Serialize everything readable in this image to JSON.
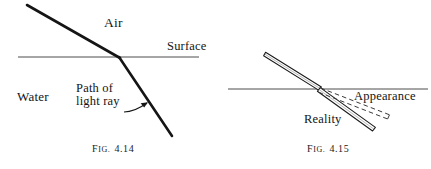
{
  "figures": [
    {
      "id": "fig-4-14",
      "caption_prefix": "F",
      "caption_prefix_small": "IG.",
      "caption_number": "4.14",
      "caption_full": "Fig. 4.14",
      "labels": {
        "air": "Air",
        "surface": "Surface",
        "water": "Water",
        "path_line1": "Path of",
        "path_line2": "light ray"
      },
      "geometry": {
        "surface_line": {
          "x1": 18,
          "y1": 57,
          "x2": 199,
          "y2": 57
        },
        "incident_ray": {
          "x1": 27,
          "y1": 5,
          "x2": 120,
          "y2": 58
        },
        "refracted_ray": {
          "x1": 120,
          "y1": 58,
          "x2": 172,
          "y2": 136
        },
        "pointer_arrow": {
          "x1": 129,
          "y1": 112,
          "x2": 148,
          "y2": 103
        }
      }
    },
    {
      "id": "fig-4-15",
      "caption_prefix": "F",
      "caption_prefix_small": "IG.",
      "caption_number": "4.15",
      "caption_full": "Fig. 4.15",
      "labels": {
        "appearance": "Appearance",
        "reality": "Reality"
      },
      "geometry": {
        "surface_line": {
          "x1": 228,
          "y1": 89,
          "x2": 428,
          "y2": 89
        },
        "stick_above": {
          "x1": 265,
          "y1": 53,
          "x2": 320,
          "y2": 89
        },
        "stick_below_real": {
          "x1": 320,
          "y1": 89,
          "x2": 374,
          "y2": 129
        },
        "stick_below_apparent": {
          "x1": 320,
          "y1": 89,
          "x2": 388,
          "y2": 118
        }
      }
    }
  ],
  "style": {
    "ink_color": "#1a1a1a",
    "rule_color": "#555555",
    "background": "#ffffff"
  }
}
